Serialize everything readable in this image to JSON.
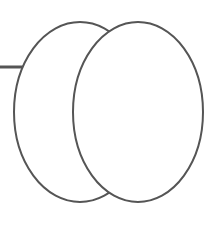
{
  "diagram": {
    "stroke_color": "#555555",
    "background_color": "#ffffff",
    "shapes": [
      {
        "name": "back-ellipse",
        "cx": 80,
        "cy": 112,
        "rx": 66,
        "ry": 90
      },
      {
        "name": "front-ellipse",
        "cx": 138,
        "cy": 112,
        "rx": 65,
        "ry": 90
      }
    ],
    "connector": {
      "x1": 0,
      "y1": 67,
      "x2": 23,
      "y2": 67
    }
  }
}
